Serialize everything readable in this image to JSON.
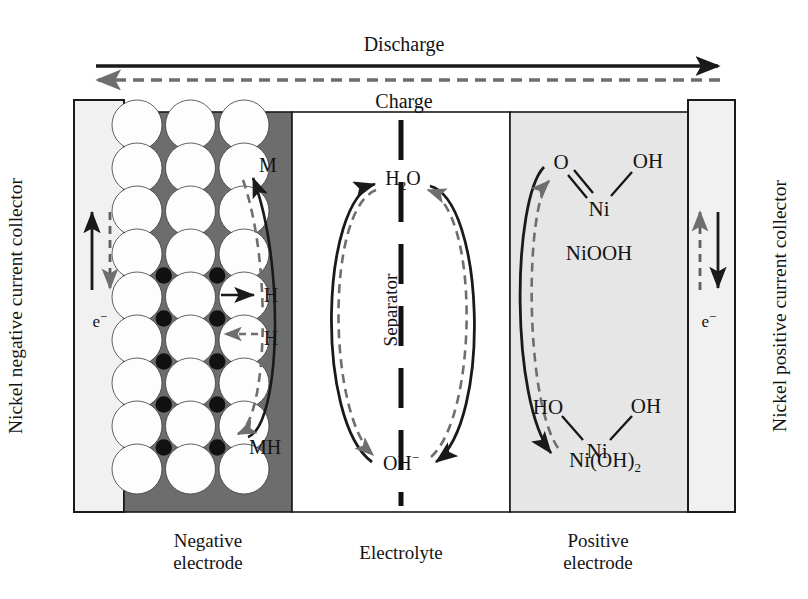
{
  "figure": {
    "title_top": "Discharge",
    "title_top2": "Charge",
    "type": "nimh-battery-cell-schematic"
  },
  "top_arrows": {
    "discharge_label": "Discharge",
    "discharge_direction": "right",
    "discharge_style": "solid",
    "charge_label": "Charge",
    "charge_direction": "left",
    "charge_style": "dashed"
  },
  "left_collector": {
    "label": "Nickel negative current collector",
    "electron_label": "e",
    "electron_charge": "−",
    "solid_arrow_direction": "up",
    "dashed_arrow_direction": "down",
    "fill": "#f1f1f1"
  },
  "negative_electrode": {
    "bottom_label_line1": "Negative",
    "bottom_label_line2": "electrode",
    "fill": "#6d6d6d",
    "particle_fill": "#fdfdfd",
    "hydrogen_fill": "#111111",
    "rows": 9,
    "cols": 3,
    "interstitial_dot_rows": 5,
    "labels": {
      "metal": "M",
      "hydrogen_out": "H",
      "hydrogen_in": "H",
      "metal_hydride": "MH"
    }
  },
  "electrolyte": {
    "bottom_label": "Electrolyte",
    "separator_label": "Separator",
    "fill": "#ffffff",
    "species_top": "H",
    "species_top_sub": "2",
    "species_top_tail": "O",
    "species_bottom": "OH",
    "species_bottom_sup": "−",
    "solid_loop_direction": "counterclockwise",
    "dashed_loop_direction": "clockwise"
  },
  "positive_electrode": {
    "bottom_label_line1": "Positive",
    "bottom_label_line2": "electrode",
    "fill": "#e6e6e6",
    "charged_species": {
      "name": "NiOOH",
      "atom_o": "O",
      "atom_oh": "OH",
      "atom_ni": "Ni",
      "bond_o_ni": "double",
      "bond_oh_ni": "single"
    },
    "discharged_species": {
      "name_base": "Ni(OH)",
      "name_sub": "2",
      "atom_ho": "HO",
      "atom_oh": "OH",
      "atom_ni": "Ni",
      "bond_ho_ni": "single",
      "bond_oh_ni": "single"
    }
  },
  "right_collector": {
    "label": "Nickel positive current collector",
    "electron_label": "e",
    "electron_charge": "−",
    "solid_arrow_direction": "down",
    "dashed_arrow_direction": "up",
    "fill": "#f1f1f1"
  },
  "colors": {
    "outline": "#1a1a1a",
    "dashed_gray": "#6e6e6e",
    "negative_fill": "#6d6d6d",
    "positive_fill": "#e6e6e6",
    "collector_fill": "#f1f1f1",
    "background": "#ffffff"
  }
}
